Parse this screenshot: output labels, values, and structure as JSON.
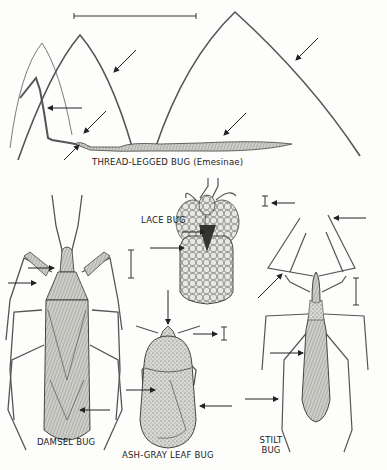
{
  "figure": {
    "background": "#fdfdfc",
    "ink_color": "#2a2a2a",
    "labels": {
      "thread_legged": "THREAD-LEGGED BUG (Emesinae)",
      "lace": "LACE BUG",
      "damsel": "DAMSEL BUG",
      "ash_gray": "ASH-GRAY LEAF BUG",
      "stilt_line1": "STILT",
      "stilt_line2": "BUG"
    },
    "specimens": [
      {
        "name": "Thread-legged bug",
        "subfamily": "Emesinae",
        "pointer_arrows": 6,
        "scale_bar": "long horizontal"
      },
      {
        "name": "Lace bug",
        "pointer_arrows": 2,
        "scale_bar": "short vertical"
      },
      {
        "name": "Damsel bug",
        "pointer_arrows": 3,
        "scale_bar": "vertical"
      },
      {
        "name": "Ash-gray leaf bug",
        "pointer_arrows": 4,
        "scale_bar": "short vertical"
      },
      {
        "name": "Stilt bug",
        "pointer_arrows": 4,
        "scale_bar": "vertical"
      }
    ]
  }
}
